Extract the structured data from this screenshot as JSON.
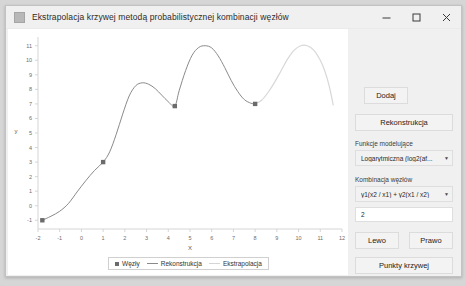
{
  "window": {
    "title": "Ekstrapolacja krzywej metodą probabilistycznej kombinacji węzłów",
    "icon": "app-icon",
    "minimize_label": "—",
    "maximize_label": "□",
    "close_label": "✕"
  },
  "controls": {
    "add_label": "Dodaj",
    "reconstruct_label": "Rekonstrukcja",
    "model_functions_label": "Funkcje modelujące",
    "model_functions_value": "Logarytmiczna (log2(af...",
    "node_combination_label": "Kombinacja węzłów",
    "node_combination_value": "y1(x2 / x1) + y2(x1 / x2)",
    "param_value": "2",
    "left_label": "Lewo",
    "right_label": "Prawo",
    "curve_points_label": "Punkty krzywej",
    "caret": "▼"
  },
  "legend": {
    "nodes_label": "Węzły",
    "reconstruction_label": "Rekonstrukcja",
    "extrapolation_label": "Ekstrapolacja"
  },
  "colors": {
    "node": "#6b6b6b",
    "reconstruction": "#8a8a8a",
    "extrapolation": "#d8d8d8",
    "axis": "#d5d5d5",
    "plot_bg": "#ffffff",
    "window_bg": "#f0f0f0"
  },
  "chart_data": {
    "type": "line",
    "title": "",
    "xlabel": "X",
    "ylabel": "y",
    "xlim": [
      -2,
      12
    ],
    "ylim": [
      -1.6,
      11.6
    ],
    "xticks": [
      -2,
      -1,
      0,
      1,
      2,
      3,
      4,
      5,
      6,
      7,
      8,
      9,
      10,
      11,
      12
    ],
    "yticks": [
      -1,
      0,
      1,
      2,
      3,
      4,
      5,
      6,
      7,
      8,
      9,
      10,
      11
    ],
    "grid": false,
    "legend_position": "bottom",
    "nodes": [
      {
        "x": -1.8,
        "y": -1.0
      },
      {
        "x": 1.0,
        "y": 3.0
      },
      {
        "x": 4.3,
        "y": 6.85
      },
      {
        "x": 8.0,
        "y": 7.0
      }
    ],
    "series": [
      {
        "name": "Rekonstrukcja",
        "color": "#8a8a8a",
        "x": [
          -1.8,
          -1.4,
          -1.0,
          -0.6,
          -0.2,
          0.2,
          0.6,
          1.0,
          1.3,
          1.6,
          1.9,
          2.2,
          2.5,
          2.8,
          3.1,
          3.4,
          3.7,
          4.0,
          4.3,
          4.5,
          4.8,
          5.1,
          5.4,
          5.7,
          6.0,
          6.3,
          6.6,
          6.9,
          7.2,
          7.5,
          7.8,
          8.0
        ],
        "y": [
          -1.0,
          -0.72,
          -0.38,
          0.15,
          0.95,
          1.72,
          2.42,
          3.0,
          3.7,
          4.9,
          6.3,
          7.55,
          8.25,
          8.45,
          8.35,
          8.05,
          7.6,
          7.15,
          6.85,
          7.9,
          9.3,
          10.35,
          10.88,
          11.0,
          10.85,
          10.3,
          9.5,
          8.6,
          7.85,
          7.3,
          7.05,
          7.0
        ]
      },
      {
        "name": "Ekstrapolacja",
        "color": "#d8d8d8",
        "x": [
          8.0,
          8.3,
          8.6,
          8.9,
          9.2,
          9.5,
          9.8,
          10.1,
          10.4,
          10.7,
          11.0,
          11.2,
          11.4,
          11.6
        ],
        "y": [
          7.0,
          7.25,
          7.8,
          8.5,
          9.3,
          10.1,
          10.7,
          11.0,
          11.0,
          10.7,
          10.0,
          9.3,
          8.3,
          6.9
        ]
      }
    ]
  }
}
